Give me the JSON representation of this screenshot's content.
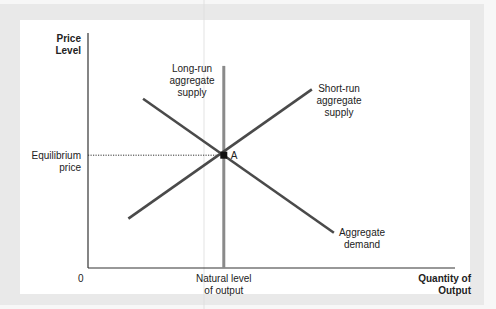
{
  "chart_data": {
    "type": "line",
    "title": "",
    "ylabel": [
      "Price",
      "Level"
    ],
    "xlabel": [
      "Quantity of",
      "Output"
    ],
    "origin_label": "0",
    "xlim": [
      0,
      10
    ],
    "ylim": [
      0,
      10
    ],
    "grid": false,
    "equilibrium": {
      "label": "A",
      "x": 3.7,
      "y": 4.8,
      "price_label": [
        "Equilibrium",
        "price"
      ],
      "quantity_label": [
        "Natural level",
        "of output"
      ]
    },
    "series": [
      {
        "name": "Long-run aggregate supply",
        "label_lines": [
          "Long-run",
          "aggregate",
          "supply"
        ],
        "points": [
          [
            3.7,
            0
          ],
          [
            3.7,
            8.6
          ]
        ],
        "color": "#8a8a8a"
      },
      {
        "name": "Short-run aggregate supply",
        "label_lines": [
          "Short-run",
          "aggregate",
          "supply"
        ],
        "points": [
          [
            1.1,
            2.1
          ],
          [
            6.1,
            7.6
          ]
        ],
        "color": "#4a4a4a"
      },
      {
        "name": "Aggregate demand",
        "label_lines": [
          "Aggregate",
          "demand"
        ],
        "points": [
          [
            1.5,
            7.2
          ],
          [
            6.7,
            1.5
          ]
        ],
        "color": "#4a4a4a"
      }
    ]
  }
}
